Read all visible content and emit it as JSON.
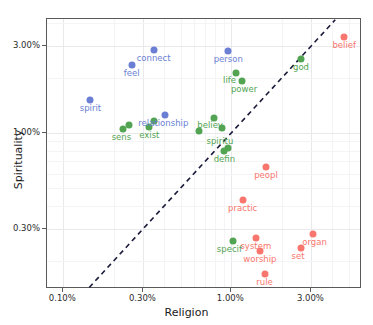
{
  "chart_data": {
    "type": "scatter",
    "title": "",
    "xlabel": "Religion",
    "ylabel": "Spirituality",
    "xscale": "log",
    "yscale": "log",
    "xlim": [
      0.08,
      6.0
    ],
    "ylim": [
      0.14,
      4.2
    ],
    "grid": true,
    "legend": "none",
    "xticks": [
      "0.10%",
      "0.30%",
      "1.00%",
      "3.00%"
    ],
    "xtick_values": [
      0.1,
      0.3,
      1.0,
      3.0
    ],
    "yticks": [
      "3.00%",
      "1.00%",
      "0.30%"
    ],
    "ytick_values": [
      3.0,
      1.0,
      0.3
    ],
    "reference_line": {
      "style": "dashed",
      "color": "#1a1a3a",
      "description": "y = x diagonal"
    },
    "series": [
      {
        "name": "blue",
        "color": "#6a7fd4",
        "points": [
          {
            "label": "spirit",
            "x": 0.145,
            "y": 1.52
          },
          {
            "label": "feel",
            "x": 0.255,
            "y": 2.35
          },
          {
            "label": "connect",
            "x": 0.345,
            "y": 2.85
          },
          {
            "label": "relationship",
            "x": 0.405,
            "y": 1.25
          },
          {
            "label": "person",
            "x": 0.96,
            "y": 2.8
          }
        ]
      },
      {
        "name": "green",
        "color": "#52a452",
        "points": [
          {
            "label": "sens",
            "x": 0.228,
            "y": 1.05
          },
          {
            "label": "",
            "x": 0.245,
            "y": 1.1
          },
          {
            "label": "exist",
            "x": 0.325,
            "y": 1.08
          },
          {
            "label": "",
            "x": 0.345,
            "y": 1.16
          },
          {
            "label": "life",
            "x": 1.06,
            "y": 2.12
          },
          {
            "label": "power",
            "x": 1.16,
            "y": 1.92
          },
          {
            "label": "believ",
            "x": 0.79,
            "y": 1.2
          },
          {
            "label": "spiritu",
            "x": 0.88,
            "y": 1.06
          },
          {
            "label": "",
            "x": 0.64,
            "y": 1.02
          },
          {
            "label": "defin",
            "x": 0.91,
            "y": 0.8
          },
          {
            "label": "",
            "x": 0.95,
            "y": 0.83
          },
          {
            "label": "god",
            "x": 2.6,
            "y": 2.55
          },
          {
            "label": "specif",
            "x": 1.03,
            "y": 0.255
          }
        ]
      },
      {
        "name": "red",
        "color": "#f8766d",
        "points": [
          {
            "label": "belief",
            "x": 4.7,
            "y": 3.35
          },
          {
            "label": "peopl",
            "x": 1.61,
            "y": 0.65
          },
          {
            "label": "practic",
            "x": 1.17,
            "y": 0.43
          },
          {
            "label": "system",
            "x": 1.4,
            "y": 0.265
          },
          {
            "label": "worship",
            "x": 1.48,
            "y": 0.225
          },
          {
            "label": "organ",
            "x": 3.05,
            "y": 0.28
          },
          {
            "label": "set",
            "x": 2.6,
            "y": 0.235
          },
          {
            "label": "rule",
            "x": 1.58,
            "y": 0.17
          }
        ]
      }
    ]
  },
  "labels": {
    "x_axis_title": "Religion",
    "y_axis_title": "Spirituality"
  }
}
